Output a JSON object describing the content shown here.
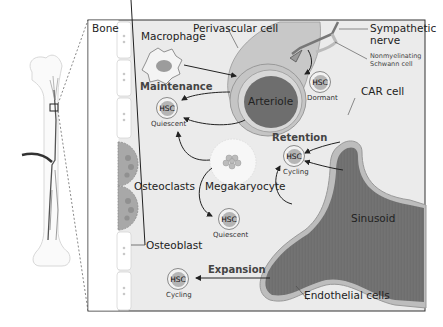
{
  "diagram": {
    "colors": {
      "marrow_bg": "#ebebeb",
      "bone_bg": "#ffffff",
      "vessel_dark": "#6e6e6e",
      "vessel_wall": "#b8b8b8",
      "border": "#333333"
    },
    "labels": {
      "bone": "Bone",
      "macrophage": "Macrophage",
      "perivascular_cell": "Perivascular cell",
      "sympathetic_nerve": "Sympathetic\nnerve",
      "sympathetic_line1": "Sympathetic",
      "sympathetic_line2": "nerve",
      "schwann_line1": "Nonmyelinating",
      "schwann_line2": "Schwann cell",
      "arteriole": "Arteriole",
      "maintenance": "Maintenance",
      "car_cell": "CAR cell",
      "retention": "Retention",
      "osteoclasts": "Osteoclasts",
      "megakaryocyte": "Megakaryocyte",
      "sinusoid": "Sinusoid",
      "osteoblast": "Osteoblast",
      "expansion": "Expansion",
      "endothelial_cells": "Endothelial cells"
    },
    "hsc_cells": [
      {
        "label": "HSC",
        "state": "Quiescent",
        "position": "maintenance"
      },
      {
        "label": "HSC",
        "state": "Dormant",
        "position": "near-nerve"
      },
      {
        "label": "HSC",
        "state": "Cycling",
        "position": "retention"
      },
      {
        "label": "HSC",
        "state": "Quiescent",
        "position": "megakaryocyte"
      },
      {
        "label": "HSC",
        "state": "Cycling",
        "position": "expansion"
      }
    ],
    "edges": [
      {
        "from": "Macrophage",
        "to": "Arteriole/Perivascular cell"
      },
      {
        "from": "Arteriole",
        "to": "HSC (Quiescent)",
        "label": "Maintenance"
      },
      {
        "from": "Sympathetic nerve",
        "to": "HSC (Dormant)"
      },
      {
        "from": "Megakaryocyte",
        "to": "HSC (Quiescent) [maintenance]"
      },
      {
        "from": "Megakaryocyte",
        "to": "HSC (Quiescent) [lower]"
      },
      {
        "from": "Megakaryocyte",
        "to": "HSC (Cycling) [retention]"
      },
      {
        "from": "CAR cell",
        "to": "HSC (Cycling)",
        "label": "Retention"
      },
      {
        "from": "Sinusoid",
        "to": "HSC (Cycling)",
        "label": "Retention"
      },
      {
        "from": "Sinusoid/Endothelial cells",
        "to": "HSC (Cycling)",
        "label": "Expansion"
      }
    ]
  }
}
